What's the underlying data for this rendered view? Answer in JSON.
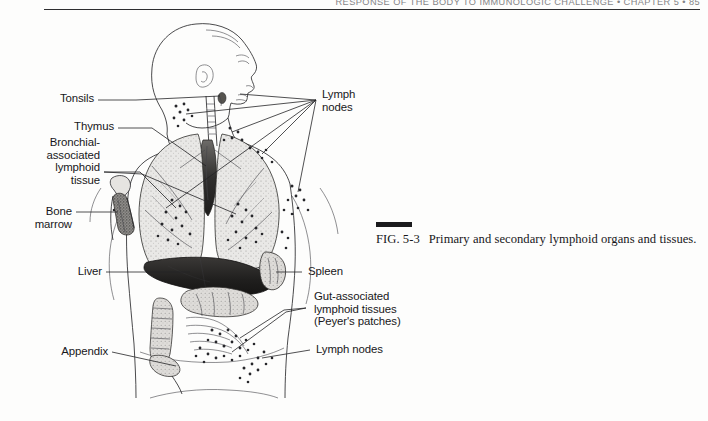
{
  "page": {
    "running_head": "RESPONSE OF THE BODY TO IMMUNOLOGIC CHALLENGE   •   CHAPTER 5   •   85",
    "background_color": "#fdfdfc",
    "ink_color": "#2a2a2d"
  },
  "figure": {
    "number": "FIG. 5-3",
    "caption": "Primary and secondary lymphoid organs and tissues."
  },
  "labels": {
    "left": [
      {
        "id": "tonsils",
        "text": "Tonsils"
      },
      {
        "id": "thymus",
        "text": "Thymus"
      },
      {
        "id": "balt",
        "text": "Bronchial-\nassociated\nlymphoid\ntissue"
      },
      {
        "id": "bone-marrow",
        "text": "Bone\nmarrow"
      },
      {
        "id": "liver",
        "text": "Liver"
      },
      {
        "id": "appendix",
        "text": "Appendix"
      }
    ],
    "right": [
      {
        "id": "lymph-nodes-upper",
        "text": "Lymph\nnodes"
      },
      {
        "id": "spleen",
        "text": "Spleen"
      },
      {
        "id": "galt",
        "text": "Gut-associated\nlymphoid tissues\n(Peyer's patches)"
      },
      {
        "id": "lymph-nodes-lower",
        "text": "Lymph nodes"
      }
    ]
  }
}
